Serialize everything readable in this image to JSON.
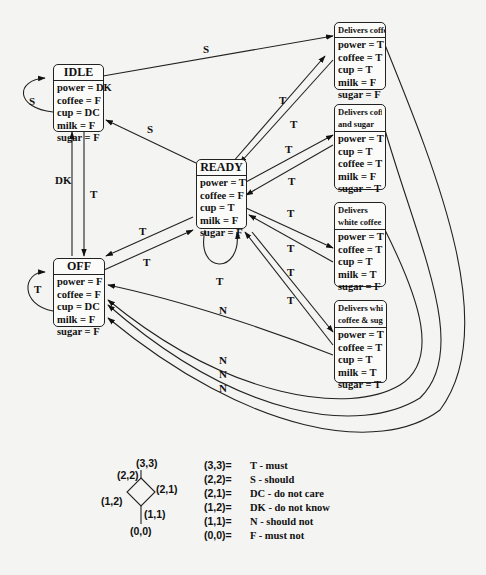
{
  "states": {
    "idle": {
      "title": "IDLE",
      "vars": [
        "power = DK",
        "coffee = F",
        "cup = DC",
        "milk = F",
        "sugar = F"
      ]
    },
    "ready": {
      "title": "READY",
      "vars": [
        "power = T",
        "coffee = F",
        "cup = T",
        "milk = F",
        "sugar = F"
      ]
    },
    "off": {
      "title": "OFF",
      "vars": [
        "power = F",
        "coffee = F",
        "cup = DC",
        "milk = F",
        "sugar = F"
      ]
    },
    "delivers_coffee": {
      "title": "Delivers coffee",
      "vars": [
        "power = T",
        "coffee = T",
        "cup = T",
        "milk = F",
        "sugar = F"
      ]
    },
    "delivers_coffee_sugar": {
      "title_line1": "Delivers coffee",
      "title_line2": "and sugar",
      "vars": [
        "power = T",
        "cup = T",
        "coffee = T",
        "milk = F",
        "sugar = T"
      ]
    },
    "delivers_white_coffee": {
      "title_line1": "Delivers",
      "title_line2": "white coffee",
      "vars": [
        "power = T",
        "coffee = T",
        "cup = T",
        "milk = T",
        "sugar = F"
      ]
    },
    "delivers_white_coffee_sugar": {
      "title_line1": "Delivers white",
      "title_line2": "coffee & sugar",
      "vars": [
        "power = T",
        "coffee = T",
        "cup = T",
        "milk = T",
        "sugar = T"
      ]
    }
  },
  "transitions": {
    "idle_self": "S",
    "idle_to_coffee": "S",
    "ready_to_idle": "S",
    "idle_to_off": "DK",
    "off_to_idle": "T",
    "off_self": "T",
    "ready_self": "T",
    "ready_to_off": "T",
    "off_to_ready": "T",
    "ready_to_coffee": "T",
    "coffee_to_ready": "T",
    "ready_to_coffee_sugar": "T",
    "coffee_sugar_to_ready": "T",
    "ready_to_white": "T",
    "white_to_ready": "T",
    "ready_to_white_sugar": "T",
    "white_sugar_to_ready": "T",
    "white_sugar_to_off": "N",
    "returns_to_off": [
      "N",
      "N",
      "N"
    ]
  },
  "legend": {
    "lattice_nodes": [
      "(3,3)",
      "(2,2)",
      "(2,1)",
      "(1,2)",
      "(1,1)",
      "(0,0)"
    ],
    "entries": [
      {
        "key": "(3,3)=",
        "value": "T - must"
      },
      {
        "key": "(2,2)=",
        "value": "S - should"
      },
      {
        "key": "(2,1)=",
        "value": "DC - do not care"
      },
      {
        "key": "(1,2)=",
        "value": "DK - do not know"
      },
      {
        "key": "(1,1)=",
        "value": "N - should not"
      },
      {
        "key": "(0,0)=",
        "value": "F - must not"
      }
    ]
  }
}
